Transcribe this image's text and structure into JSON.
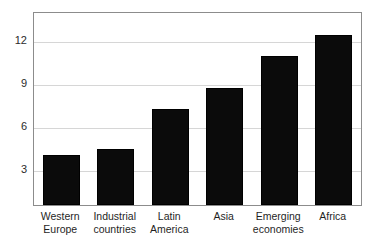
{
  "chart_data": {
    "type": "bar",
    "title": "",
    "subtitle": "",
    "xlabel": "",
    "ylabel": "",
    "categories": [
      "Western\nEurope",
      "Industrial\ncountries",
      "Latin\nAmerica",
      "Asia",
      "Emerging\neconomies",
      "Africa"
    ],
    "values": [
      4.1,
      4.5,
      7.3,
      8.8,
      11.0,
      12.5
    ],
    "yticks": [
      3,
      6,
      9,
      12
    ],
    "ytick_labels": [
      "3",
      "6",
      "9",
      "12"
    ],
    "ylim": [
      0.6,
      14.0
    ],
    "grid": true,
    "grid_axis": "y",
    "legend": "none",
    "bar_color": "#0b0b0b",
    "grid_color": "#d6d6d6",
    "frame_color": "#8c8c8c",
    "background_color": "#ffffff"
  },
  "axes": {
    "y_tick_0": "3",
    "y_tick_1": "6",
    "y_tick_2": "9",
    "y_tick_3": "12"
  },
  "bars": [
    {
      "label": "Western\nEurope",
      "value": 4.1
    },
    {
      "label": "Industrial\ncountries",
      "value": 4.5
    },
    {
      "label": "Latin\nAmerica",
      "value": 7.3
    },
    {
      "label": "Asia",
      "value": 8.8
    },
    {
      "label": "Emerging\neconomies",
      "value": 11.0
    },
    {
      "label": "Africa",
      "value": 12.5
    }
  ]
}
